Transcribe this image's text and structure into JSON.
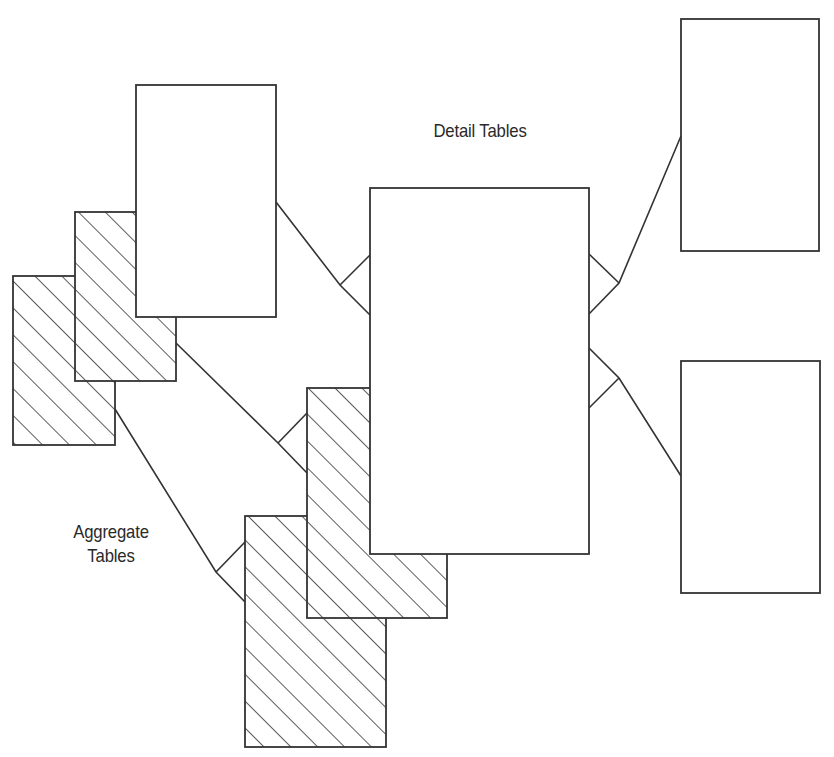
{
  "labels": {
    "detail": "Detail Tables",
    "aggregate_line1": "Aggregate",
    "aggregate_line2": "Tables"
  },
  "style": {
    "stroke": "#333333",
    "fill": "#ffffff",
    "hatch": "#333333"
  },
  "tables": [
    {
      "id": "agg-1",
      "kind": "aggregate",
      "x": 13,
      "y": 276,
      "w": 102,
      "h": 169
    },
    {
      "id": "agg-2",
      "kind": "aggregate",
      "x": 75,
      "y": 212,
      "w": 101,
      "h": 169
    },
    {
      "id": "detail-1",
      "kind": "detail",
      "x": 136,
      "y": 85,
      "w": 140,
      "h": 232
    },
    {
      "id": "agg-3",
      "kind": "aggregate",
      "x": 245,
      "y": 516,
      "w": 141,
      "h": 231
    },
    {
      "id": "agg-4",
      "kind": "aggregate",
      "x": 307,
      "y": 388,
      "w": 140,
      "h": 230
    },
    {
      "id": "detail-center",
      "kind": "detail",
      "x": 370,
      "y": 188,
      "w": 219,
      "h": 366
    },
    {
      "id": "detail-right-top",
      "kind": "detail",
      "x": 681,
      "y": 19,
      "w": 138,
      "h": 232
    },
    {
      "id": "detail-right-bottom",
      "kind": "detail",
      "x": 681,
      "y": 361,
      "w": 139,
      "h": 232
    }
  ],
  "relationships": [
    {
      "from": "detail-1",
      "to": "detail-center",
      "points": [
        [
          276,
          202
        ],
        [
          340,
          285
        ],
        [
          370,
          315
        ]
      ],
      "crow_branch": [
        [
          340,
          285
        ],
        [
          370,
          255
        ]
      ]
    },
    {
      "from": "agg-2",
      "to": "agg-4",
      "points": [
        [
          176,
          343
        ],
        [
          278,
          443
        ],
        [
          307,
          473
        ]
      ],
      "crow_branch": [
        [
          278,
          443
        ],
        [
          307,
          413
        ]
      ]
    },
    {
      "from": "agg-1",
      "to": "agg-3",
      "points": [
        [
          115,
          409
        ],
        [
          216,
          572
        ],
        [
          245,
          602
        ]
      ],
      "crow_branch": [
        [
          216,
          572
        ],
        [
          245,
          542
        ]
      ]
    },
    {
      "from": "detail-right-top",
      "to": "detail-center",
      "points": [
        [
          681,
          136
        ],
        [
          619,
          283
        ],
        [
          589,
          314
        ]
      ],
      "crow_branch": [
        [
          619,
          283
        ],
        [
          589,
          254
        ]
      ]
    },
    {
      "from": "detail-right-bottom",
      "to": "detail-center",
      "points": [
        [
          681,
          476
        ],
        [
          619,
          378
        ],
        [
          589,
          348
        ]
      ],
      "crow_branch": [
        [
          619,
          378
        ],
        [
          589,
          408
        ]
      ]
    }
  ]
}
